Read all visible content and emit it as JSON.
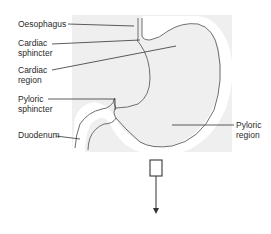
{
  "diagram": {
    "background_panel_color": "#efefef",
    "outline_color": "#6e6e6e",
    "leader_color": "#333333",
    "labels": {
      "oesophagus": {
        "line1": "Oesophagus"
      },
      "cardiac_sphincter": {
        "line1": "Cardiac",
        "line2": "sphincter"
      },
      "cardiac_region": {
        "line1": "Cardiac",
        "line2": "region"
      },
      "pyloric_sphincter": {
        "line1": "Pyloric",
        "line2": "sphincter"
      },
      "duodenum": {
        "line1": "Duodenum"
      },
      "pyloric_region": {
        "line1": "Pyloric",
        "line2": "region"
      }
    },
    "callout": {
      "shape": "rectangle",
      "pointer": "down-arrow"
    }
  }
}
